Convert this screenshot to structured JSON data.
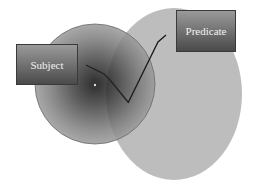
{
  "diagram": {
    "labels": {
      "subject": "Subject",
      "predicate": "Predicate"
    },
    "shapes": {
      "subject_circle": {
        "cx": 95,
        "cy": 84,
        "r": 60,
        "center_color": "#0a0a0a",
        "edge_color": "#9a9a9a"
      },
      "predicate_ellipse": {
        "cx": 174,
        "cy": 94,
        "rx": 68,
        "ry": 86,
        "color": "#bdbdbd"
      }
    },
    "connectors": [
      {
        "from": "subject",
        "points": "86,65 104,74 110,80 128,102"
      },
      {
        "from": "predicate",
        "points": "128,103 158,42 166,35"
      }
    ]
  }
}
